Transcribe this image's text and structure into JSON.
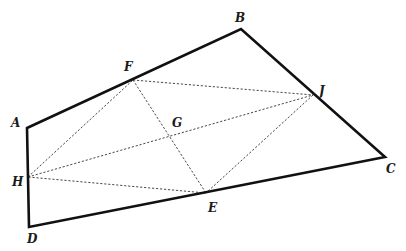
{
  "diagram": {
    "type": "geometry-figure",
    "points": {
      "A": {
        "x": 27,
        "y": 128,
        "label": "A"
      },
      "B": {
        "x": 241,
        "y": 29,
        "label": "B"
      },
      "C": {
        "x": 385,
        "y": 157,
        "label": "C"
      },
      "D": {
        "x": 29,
        "y": 227,
        "label": "D"
      },
      "F": {
        "x": 133,
        "y": 80,
        "label": "F"
      },
      "J": {
        "x": 313,
        "y": 95,
        "label": "J"
      },
      "E": {
        "x": 206,
        "y": 193,
        "label": "E"
      },
      "H": {
        "x": 28,
        "y": 177,
        "label": "H"
      },
      "G": {
        "x": 170,
        "y": 136,
        "label": "G"
      }
    },
    "solid_edges": [
      [
        "A",
        "B"
      ],
      [
        "B",
        "C"
      ],
      [
        "C",
        "E"
      ],
      [
        "E",
        "D"
      ],
      [
        "D",
        "A"
      ]
    ],
    "dashed_edges": [
      [
        "F",
        "J"
      ],
      [
        "J",
        "E"
      ],
      [
        "E",
        "H"
      ],
      [
        "H",
        "F"
      ],
      [
        "F",
        "E"
      ],
      [
        "H",
        "J"
      ]
    ],
    "colors": {
      "background": "#ffffff",
      "solid_stroke": "#111111",
      "dashed_stroke": "#333333",
      "label": "#1a1a1a"
    }
  }
}
